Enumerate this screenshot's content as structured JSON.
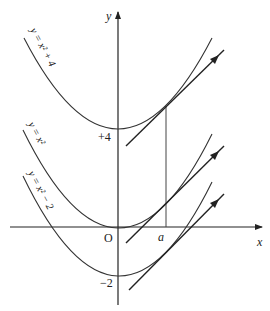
{
  "diagram": {
    "axes": {
      "x_label": "x",
      "y_label": "y",
      "origin_label": "O"
    },
    "tick_labels": {
      "plus_four": "+4",
      "minus_two": "−2",
      "a": "a"
    },
    "curves": [
      {
        "name": "y = x² + 4",
        "label": "y = x² + 4",
        "vertex_y": 4
      },
      {
        "name": "y = x²",
        "label": "y = x²",
        "vertex_y": 0
      },
      {
        "name": "y = x² − 2",
        "label": "y = x² − 2",
        "vertex_y": -2
      }
    ]
  }
}
